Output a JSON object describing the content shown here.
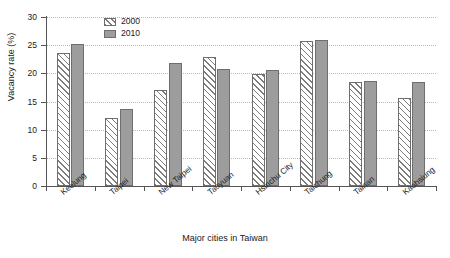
{
  "chart_data": {
    "type": "bar",
    "title": "",
    "xlabel": "Major cities in Taiwan",
    "ylabel": "Vacancy rate (%)",
    "ylim": [
      0,
      30
    ],
    "yticks": [
      0,
      5,
      10,
      15,
      20,
      25,
      30
    ],
    "grid": true,
    "legend_position": "top-center",
    "categories": [
      "Keelung",
      "Taipei",
      "New Taipei",
      "Taoyuan",
      "Hsinchu City",
      "Taichung",
      "Tainan",
      "Kaohsiung"
    ],
    "series": [
      {
        "name": "2000",
        "values": [
          23.7,
          12.0,
          17.1,
          22.9,
          19.8,
          25.7,
          18.4,
          15.6
        ]
      },
      {
        "name": "2010",
        "values": [
          25.2,
          13.6,
          21.9,
          20.7,
          20.6,
          25.9,
          18.7,
          18.5
        ]
      }
    ],
    "colors": {
      "series_2000_fill": "#ffffff",
      "series_2000_hatch": "#7c7c7c",
      "series_2010_fill": "#9d9d9d",
      "bar_outline": "#6e6e6e",
      "axis": "#555555",
      "gridline": "#b9b9b9"
    }
  },
  "legend": {
    "items": [
      {
        "label": "2000"
      },
      {
        "label": "2010"
      }
    ]
  }
}
